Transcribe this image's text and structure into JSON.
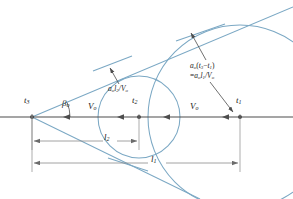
{
  "figure": {
    "type": "supersonic-mach-cone-construction-diagram",
    "background_color": "#ffffff",
    "line_color": "#4d4d4d",
    "wave_color": "#7ba8c4",
    "text_color": "#1a1a1a"
  },
  "labels": {
    "t3": "t",
    "t3_sub": "3",
    "t2": "t",
    "t2_sub": "2",
    "t1": "t",
    "t1_sub": "1",
    "beta": "β",
    "beta_sub": "o",
    "v_left": "V",
    "v_left_sub": "o",
    "v_right": "V",
    "v_right_sub": "o",
    "l2": "l",
    "l2_sub": "2",
    "l1": "l",
    "l1_sub": "1"
  },
  "annotations": {
    "small_wave": {
      "a": "a",
      "a_sub": "o",
      "l": "l",
      "l_sub": "2",
      "slash": "/",
      "v": "V",
      "v_sub": "o",
      "full_text": "a_o l_2 / V_o"
    },
    "large_wave": {
      "line1_a": "a",
      "line1_a_sub": "o",
      "line1_open": "(",
      "line1_t3": "t",
      "line1_t3_sub": "3",
      "line1_minus": "−",
      "line1_t1": "t",
      "line1_t1_sub": "1",
      "line1_close": ")",
      "line2_eq": "=",
      "line2_a": "a",
      "line2_a_sub": "o",
      "line2_l": "l",
      "line2_l_sub": "1",
      "line2_slash": "/",
      "line2_v": "V",
      "line2_v_sub": "o",
      "full_text": "a_o(t_3 - t_1) = a_o l_1 / V_o"
    }
  },
  "geometry": {
    "apex_x": 32,
    "apex_y": 117,
    "t2_x": 139,
    "t1_x": 240,
    "axis_y": 117,
    "axis_left": 0,
    "axis_right": 293,
    "mach_angle_deg": 22,
    "small_radius": 41,
    "large_radius": 92,
    "dim_l2_y": 141,
    "dim_l1_y": 163
  }
}
